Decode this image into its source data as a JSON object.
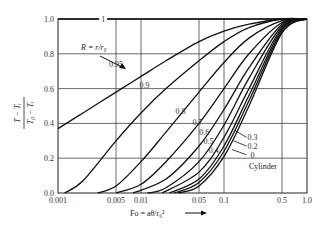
{
  "chart_data": {
    "type": "line",
    "title": "",
    "xlabel": "Fo = aθ/r₀²",
    "ylabel_numerator": "T − Tᵢ",
    "ylabel_denominator": "T₀ − Tᵢ",
    "xscale": "log",
    "xlim": [
      0.001,
      1.0
    ],
    "ylim": [
      0.0,
      1.0
    ],
    "grid": true,
    "x_ticks": [
      {
        "value": 0.001,
        "label": "0.001"
      },
      {
        "value": 0.005,
        "label": "0.005"
      },
      {
        "value": 0.01,
        "label": "0.01"
      },
      {
        "value": 0.05,
        "label": "0.05"
      },
      {
        "value": 0.1,
        "label": "0.1"
      },
      {
        "value": 0.5,
        "label": "0.5"
      },
      {
        "value": 1.0,
        "label": "1.0"
      }
    ],
    "y_ticks": [
      {
        "value": 0.0,
        "label": "0.0"
      },
      {
        "value": 0.2,
        "label": "0.2"
      },
      {
        "value": 0.4,
        "label": "0.4"
      },
      {
        "value": 0.6,
        "label": "0.6"
      },
      {
        "value": 0.8,
        "label": "0.8"
      },
      {
        "value": 1.0,
        "label": "1.0"
      }
    ],
    "parameter_label": "R = r/r₀",
    "annotation": "Cylinder",
    "series": [
      {
        "name": "1",
        "x": [
          0.001,
          1.0
        ],
        "y": [
          1.0,
          1.0
        ]
      },
      {
        "name": "0.95",
        "x": [
          0.001,
          0.002,
          0.005,
          0.01,
          0.02,
          0.05,
          0.1,
          0.2,
          0.5,
          1.0
        ],
        "y": [
          0.37,
          0.46,
          0.58,
          0.67,
          0.76,
          0.87,
          0.93,
          0.97,
          1.0,
          1.0
        ]
      },
      {
        "name": "0.9",
        "x": [
          0.0012,
          0.002,
          0.005,
          0.01,
          0.02,
          0.05,
          0.1,
          0.2,
          0.5,
          1.0
        ],
        "y": [
          0.0,
          0.07,
          0.3,
          0.46,
          0.6,
          0.76,
          0.87,
          0.95,
          1.0,
          1.0
        ]
      },
      {
        "name": "0.8",
        "x": [
          0.003,
          0.005,
          0.01,
          0.02,
          0.05,
          0.1,
          0.2,
          0.5,
          1.0
        ],
        "y": [
          0.0,
          0.04,
          0.18,
          0.35,
          0.58,
          0.75,
          0.89,
          0.99,
          1.0
        ]
      },
      {
        "name": "0.7",
        "x": [
          0.005,
          0.01,
          0.02,
          0.05,
          0.1,
          0.2,
          0.5,
          1.0
        ],
        "y": [
          0.0,
          0.05,
          0.18,
          0.4,
          0.6,
          0.8,
          0.98,
          1.0
        ]
      },
      {
        "name": "0.6",
        "x": [
          0.008,
          0.02,
          0.05,
          0.1,
          0.2,
          0.5,
          1.0
        ],
        "y": [
          0.0,
          0.08,
          0.27,
          0.48,
          0.72,
          0.97,
          1.0
        ]
      },
      {
        "name": "0.5",
        "x": [
          0.012,
          0.02,
          0.05,
          0.1,
          0.2,
          0.5,
          1.0
        ],
        "y": [
          0.0,
          0.03,
          0.18,
          0.39,
          0.66,
          0.96,
          1.0
        ]
      },
      {
        "name": "0.4",
        "x": [
          0.018,
          0.05,
          0.1,
          0.2,
          0.5,
          1.0
        ],
        "y": [
          0.0,
          0.12,
          0.32,
          0.6,
          0.95,
          1.0
        ]
      },
      {
        "name": "0.3",
        "x": [
          0.022,
          0.05,
          0.1,
          0.2,
          0.5,
          1.0
        ],
        "y": [
          0.0,
          0.08,
          0.27,
          0.56,
          0.94,
          1.0
        ]
      },
      {
        "name": "0.2",
        "x": [
          0.025,
          0.05,
          0.1,
          0.2,
          0.5,
          1.0
        ],
        "y": [
          0.0,
          0.06,
          0.24,
          0.53,
          0.93,
          1.0
        ]
      },
      {
        "name": "0",
        "x": [
          0.028,
          0.05,
          0.1,
          0.2,
          0.5,
          1.0
        ],
        "y": [
          0.0,
          0.04,
          0.21,
          0.5,
          0.92,
          1.0
        ]
      }
    ],
    "curve_labels": [
      {
        "series": "1",
        "text": "1",
        "at": [
          0.0035,
          1.0
        ]
      },
      {
        "series": "0.95",
        "text": "0.95",
        "at": [
          0.005,
          0.74
        ]
      },
      {
        "series": "0.9",
        "text": "0.9",
        "at": [
          0.011,
          0.62
        ]
      },
      {
        "series": "0.8",
        "text": "0.8",
        "at": [
          0.03,
          0.47
        ]
      },
      {
        "series": "0.7",
        "text": "0.7",
        "at": [
          0.048,
          0.41
        ]
      },
      {
        "series": "0.6",
        "text": "0.6",
        "at": [
          0.058,
          0.35
        ]
      },
      {
        "series": "0.5",
        "text": "0.5",
        "at": [
          0.065,
          0.3
        ]
      },
      {
        "series": "0.4",
        "text": "0.4",
        "at": [
          0.075,
          0.25
        ]
      },
      {
        "series": "0.3",
        "text": "0.3",
        "at": [
          0.22,
          0.32
        ]
      },
      {
        "series": "0.2",
        "text": "0.2",
        "at": [
          0.22,
          0.27
        ]
      },
      {
        "series": "0",
        "text": "0",
        "at": [
          0.22,
          0.22
        ]
      }
    ]
  }
}
